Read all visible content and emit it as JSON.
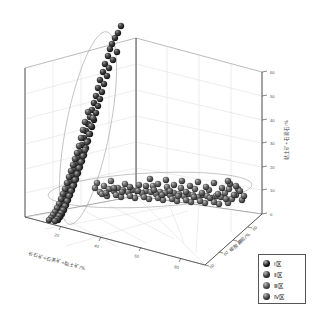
{
  "figure": {
    "kind": "3d-scatter",
    "background": "#ffffff",
    "frame_color": "#6f6f6f",
    "grid_color": "#cfcfcf",
    "ellipse_color": "#8a8a8a"
  },
  "axes": {
    "z": {
      "title": "黏土矿+石膏石/%",
      "ticks": [
        "0",
        "10",
        "20",
        "30",
        "40",
        "50",
        "60"
      ],
      "min": 0,
      "max": 60
    },
    "y": {
      "title": "碳酸盐岩/%",
      "ticks": [
        "50",
        "60",
        "70",
        "80"
      ],
      "min": 40,
      "max": 80
    },
    "x": {
      "title": "长石矿+石英矿+黏土矿/%",
      "ticks": [
        "20",
        "40",
        "60",
        "80"
      ],
      "min": 10,
      "max": 90
    }
  },
  "legend": {
    "items": [
      {
        "label": "Ⅰ区",
        "color": "#141414"
      },
      {
        "label": "Ⅱ区",
        "color": "#303030"
      },
      {
        "label": "Ⅲ区",
        "color": "#4a4a4a"
      },
      {
        "label": "Ⅳ区",
        "color": "#3a3a3a"
      }
    ]
  },
  "chart_data": {
    "type": "scatter",
    "title": "",
    "xlabel": "长石矿+石英矿+黏土矿/%",
    "ylabel": "碳酸盐岩/%",
    "zlabel": "黏土矿+石膏石/%",
    "xlim": [
      10,
      90
    ],
    "ylim": [
      40,
      80
    ],
    "zlim": [
      0,
      60
    ],
    "grid": true,
    "legend_position": "bottom-right",
    "annotations": [
      "ellipse enclosing vertical (high clay+gypsum) cluster on left wall",
      "ellipse enclosing horizontal (low clay+gypsum) cluster on floor"
    ],
    "series": [
      {
        "name": "Ⅰ区",
        "marker": "sphere",
        "color": "#141414",
        "points_px": [
          [
            121,
            26
          ],
          [
            118,
            33
          ],
          [
            115,
            38
          ],
          [
            112,
            44
          ],
          [
            110,
            49
          ],
          [
            117,
            52
          ],
          [
            108,
            56
          ],
          [
            113,
            60
          ],
          [
            105,
            64
          ],
          [
            109,
            68
          ],
          [
            103,
            72
          ],
          [
            107,
            76
          ],
          [
            100,
            80
          ],
          [
            104,
            84
          ],
          [
            98,
            88
          ],
          [
            102,
            92
          ],
          [
            96,
            96
          ],
          [
            100,
            99
          ],
          [
            94,
            103
          ],
          [
            98,
            106
          ],
          [
            92,
            110
          ],
          [
            96,
            113
          ],
          [
            90,
            117
          ],
          [
            94,
            120
          ],
          [
            88,
            124
          ],
          [
            92,
            127
          ],
          [
            86,
            131
          ],
          [
            90,
            134
          ],
          [
            84,
            138
          ],
          [
            88,
            141
          ],
          [
            82,
            145
          ],
          [
            86,
            148
          ],
          [
            80,
            152
          ],
          [
            84,
            155
          ],
          [
            78,
            158
          ],
          [
            82,
            161
          ],
          [
            76,
            164
          ],
          [
            80,
            167
          ],
          [
            74,
            170
          ],
          [
            78,
            173
          ],
          [
            72,
            176
          ],
          [
            76,
            179
          ],
          [
            70,
            182
          ],
          [
            74,
            185
          ],
          [
            68,
            188
          ],
          [
            72,
            190
          ],
          [
            66,
            193
          ],
          [
            70,
            195
          ],
          [
            64,
            198
          ],
          [
            68,
            200
          ],
          [
            62,
            203
          ],
          [
            66,
            205
          ],
          [
            60,
            208
          ],
          [
            64,
            210
          ],
          [
            58,
            213
          ],
          [
            62,
            214
          ],
          [
            56,
            216
          ],
          [
            60,
            217
          ],
          [
            54,
            219
          ],
          [
            58,
            220
          ]
        ]
      },
      {
        "name": "Ⅱ区",
        "marker": "sphere",
        "color": "#303030",
        "points_px": [
          [
            88,
            112
          ],
          [
            93,
            118
          ],
          [
            85,
            122
          ],
          [
            91,
            126
          ],
          [
            83,
            130
          ],
          [
            89,
            134
          ],
          [
            81,
            138
          ],
          [
            87,
            142
          ],
          [
            79,
            146
          ],
          [
            85,
            150
          ],
          [
            77,
            153
          ],
          [
            83,
            156
          ],
          [
            75,
            159
          ],
          [
            81,
            162
          ],
          [
            73,
            165
          ],
          [
            79,
            168
          ],
          [
            71,
            171
          ],
          [
            77,
            174
          ],
          [
            69,
            177
          ],
          [
            75,
            180
          ],
          [
            67,
            183
          ],
          [
            73,
            186
          ],
          [
            65,
            189
          ],
          [
            71,
            191
          ],
          [
            63,
            194
          ],
          [
            69,
            196
          ],
          [
            61,
            199
          ],
          [
            67,
            201
          ],
          [
            59,
            204
          ],
          [
            65,
            206
          ],
          [
            57,
            208
          ],
          [
            63,
            210
          ],
          [
            55,
            212
          ],
          [
            61,
            213
          ],
          [
            53,
            215
          ],
          [
            59,
            216
          ],
          [
            51,
            218
          ],
          [
            57,
            219
          ],
          [
            49,
            220
          ],
          [
            55,
            221
          ]
        ]
      },
      {
        "name": "Ⅲ区",
        "marker": "sphere",
        "color": "#4a4a4a",
        "points_px": [
          [
            97,
            183
          ],
          [
            104,
            186
          ],
          [
            111,
            181
          ],
          [
            118,
            188
          ],
          [
            125,
            184
          ],
          [
            132,
            190
          ],
          [
            139,
            185
          ],
          [
            146,
            191
          ],
          [
            153,
            186
          ],
          [
            160,
            192
          ],
          [
            167,
            187
          ],
          [
            174,
            193
          ],
          [
            181,
            188
          ],
          [
            188,
            194
          ],
          [
            195,
            189
          ],
          [
            202,
            195
          ],
          [
            209,
            190
          ],
          [
            216,
            196
          ],
          [
            100,
            192
          ],
          [
            107,
            196
          ],
          [
            114,
            191
          ],
          [
            121,
            197
          ],
          [
            128,
            192
          ],
          [
            135,
            198
          ],
          [
            142,
            193
          ],
          [
            149,
            199
          ],
          [
            156,
            194
          ],
          [
            163,
            200
          ],
          [
            170,
            195
          ],
          [
            177,
            201
          ],
          [
            184,
            196
          ],
          [
            191,
            202
          ],
          [
            198,
            197
          ],
          [
            205,
            203
          ],
          [
            212,
            198
          ],
          [
            219,
            204
          ],
          [
            95,
            188
          ],
          [
            102,
            194
          ],
          [
            109,
            189
          ],
          [
            116,
            195
          ],
          [
            123,
            190
          ],
          [
            130,
            196
          ],
          [
            137,
            191
          ],
          [
            144,
            197
          ],
          [
            151,
            192
          ],
          [
            158,
            198
          ],
          [
            165,
            193
          ],
          [
            172,
            199
          ],
          [
            179,
            194
          ],
          [
            186,
            200
          ],
          [
            193,
            195
          ],
          [
            200,
            201
          ],
          [
            207,
            196
          ],
          [
            214,
            202
          ],
          [
            221,
            197
          ],
          [
            228,
            203
          ],
          [
            225,
            193
          ],
          [
            232,
            199
          ],
          [
            229,
            189
          ],
          [
            236,
            195
          ]
        ]
      },
      {
        "name": "Ⅳ区",
        "marker": "sphere",
        "color": "#3a3a3a",
        "points_px": [
          [
            150,
            179
          ],
          [
            158,
            184
          ],
          [
            166,
            180
          ],
          [
            174,
            185
          ],
          [
            182,
            181
          ],
          [
            190,
            186
          ],
          [
            198,
            182
          ],
          [
            206,
            187
          ],
          [
            214,
            183
          ],
          [
            222,
            188
          ],
          [
            230,
            184
          ],
          [
            238,
            189
          ],
          [
            154,
            190
          ],
          [
            162,
            195
          ],
          [
            170,
            191
          ],
          [
            178,
            196
          ],
          [
            186,
            192
          ],
          [
            194,
            197
          ],
          [
            202,
            193
          ],
          [
            210,
            198
          ],
          [
            218,
            194
          ],
          [
            226,
            199
          ],
          [
            234,
            195
          ],
          [
            242,
            200
          ],
          [
            146,
            186
          ],
          [
            138,
            191
          ],
          [
            130,
            187
          ],
          [
            122,
            192
          ],
          [
            114,
            188
          ],
          [
            106,
            193
          ],
          [
            240,
            191
          ],
          [
            244,
            196
          ],
          [
            236,
            186
          ],
          [
            228,
            181
          ]
        ]
      }
    ]
  }
}
